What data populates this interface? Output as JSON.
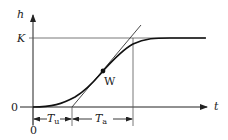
{
  "diagram": {
    "type": "step-response",
    "axes": {
      "y_label": "h",
      "x_label": "t",
      "y_level_label": "K",
      "origin_y_label": "0",
      "origin_x_label": "0"
    },
    "point": {
      "label": "W"
    },
    "dimensions": {
      "tu_main": "T",
      "tu_sub": "u",
      "ta_main": "T",
      "ta_sub": "a"
    },
    "colors": {
      "line": "#222222",
      "guide": "#555555",
      "background": "#ffffff"
    }
  }
}
